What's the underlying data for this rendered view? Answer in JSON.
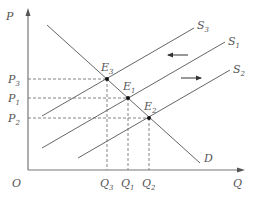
{
  "axes": {
    "y_label": "P",
    "x_label": "Q",
    "origin_label": "O"
  },
  "price_labels": [
    {
      "main": "P",
      "sub": "3"
    },
    {
      "main": "P",
      "sub": "1"
    },
    {
      "main": "P",
      "sub": "2"
    }
  ],
  "quantity_labels": [
    {
      "main": "Q",
      "sub": "3"
    },
    {
      "main": "Q",
      "sub": "1"
    },
    {
      "main": "Q",
      "sub": "2"
    }
  ],
  "curves": {
    "supply": [
      {
        "main": "S",
        "sub": "3"
      },
      {
        "main": "S",
        "sub": "1"
      },
      {
        "main": "S",
        "sub": "2"
      }
    ],
    "demand": {
      "main": "D"
    }
  },
  "equilibria": [
    {
      "main": "E",
      "sub": "3"
    },
    {
      "main": "E",
      "sub": "1"
    },
    {
      "main": "E",
      "sub": "2"
    }
  ],
  "arrows": [
    {
      "direction": "left",
      "meaning": "supply decrease S1 to S3"
    },
    {
      "direction": "right",
      "meaning": "supply increase S1 to S2"
    }
  ],
  "colors": {
    "line": "#666666",
    "axis": "#777777",
    "text": "#555555",
    "point": "#111111"
  }
}
